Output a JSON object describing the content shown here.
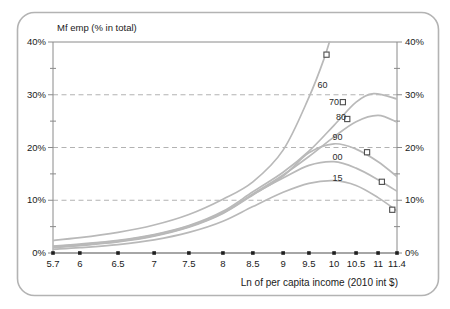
{
  "chart_data": {
    "type": "line",
    "title": "Mf emp (% in total)",
    "xlabel": "Ln of per capita income (2010 int $)",
    "ylabel": "",
    "ylim": [
      0,
      40
    ],
    "grid": "dashed-horizontal",
    "legend_position": "labels-on-curves",
    "y_major_ticks": [
      0,
      10,
      20,
      30,
      40
    ],
    "y_major_labels": [
      "0%",
      "10%",
      "20%",
      "30%",
      "40%"
    ],
    "y_minor_ticks": [
      5,
      15,
      25,
      35
    ],
    "dashed_gridlines": [
      10,
      20,
      30
    ],
    "x_ticks": [
      5.7,
      6,
      6.5,
      7,
      7.5,
      8,
      8.5,
      9,
      9.5,
      10,
      10.5,
      11,
      11.4
    ],
    "x_tick_labels": [
      "5.7",
      "6",
      "6.5",
      "7",
      "7.5",
      "8",
      "8.5",
      "9",
      "9.5",
      "10",
      "10.5",
      "11",
      "11.4"
    ],
    "x_tick_fractions": [
      0,
      0.078,
      0.189,
      0.294,
      0.395,
      0.494,
      0.581,
      0.669,
      0.744,
      0.817,
      0.881,
      0.945,
      1
    ],
    "colors": {
      "curve": "#b9b9b9",
      "gridline": "#a9a9a9",
      "axis": "#8a8a8a",
      "bottom_axis": "#4f4f4f",
      "tick_dot": "#1f1f1f",
      "marker_stroke": "#4d4d4d",
      "text": "#1a1a1a",
      "frame_border": "#b3b3b3"
    },
    "series": [
      {
        "name": "1960",
        "label": "60",
        "x": [
          5.7,
          6,
          6.5,
          7,
          7.5,
          8,
          8.5,
          9,
          9.5,
          9.8,
          9.97
        ],
        "y": [
          2.4,
          2.9,
          3.9,
          5.3,
          7.3,
          10.2,
          13.5,
          19.5,
          29.5,
          36.8,
          42.0
        ],
        "marker": {
          "x": 9.85,
          "y": 37.6
        },
        "label_at": {
          "x": 9.77,
          "y": 31.9
        }
      },
      {
        "name": "1970",
        "label": "70",
        "x": [
          5.7,
          6,
          6.5,
          7,
          7.5,
          8,
          8.5,
          9,
          9.5,
          10,
          10.5,
          10.9,
          11.4
        ],
        "y": [
          1.3,
          1.7,
          2.4,
          3.5,
          5.2,
          7.9,
          11.6,
          15.3,
          19.3,
          24.2,
          28.6,
          30.2,
          29.2
        ],
        "marker": {
          "x": 10.2,
          "y": 28.6
        },
        "label_at": {
          "x": 10.0,
          "y": 28.7
        }
      },
      {
        "name": "1980",
        "label": "80",
        "x": [
          5.7,
          6,
          6.5,
          7,
          7.5,
          8,
          8.5,
          9,
          9.5,
          10,
          10.5,
          11,
          11.4
        ],
        "y": [
          1.1,
          1.5,
          2.2,
          3.3,
          5.0,
          7.6,
          11.2,
          14.8,
          18.3,
          22.0,
          24.9,
          26.1,
          24.8
        ],
        "marker": {
          "x": 10.3,
          "y": 25.4
        },
        "label_at": {
          "x": 10.16,
          "y": 25.7
        }
      },
      {
        "name": "1990",
        "label": "90",
        "x": [
          5.7,
          6,
          6.5,
          7,
          7.5,
          8,
          8.5,
          9,
          9.5,
          10,
          10.5,
          11,
          11.4
        ],
        "y": [
          1.0,
          1.4,
          2.1,
          3.2,
          4.9,
          7.5,
          11.0,
          14.6,
          19.0,
          20.7,
          19.7,
          17.3,
          14.5
        ],
        "marker": {
          "x": 10.75,
          "y": 19.1
        },
        "label_at": {
          "x": 10.08,
          "y": 22.0
        }
      },
      {
        "name": "2000",
        "label": "00",
        "x": [
          5.7,
          6,
          6.5,
          7,
          7.5,
          8,
          8.5,
          9,
          9.5,
          10,
          10.5,
          11,
          11.4
        ],
        "y": [
          1.2,
          1.6,
          2.3,
          3.4,
          5.1,
          7.7,
          11.1,
          14.2,
          16.6,
          17.3,
          16.1,
          13.9,
          11.7
        ],
        "marker": {
          "x": 11.08,
          "y": 13.5
        },
        "label_at": {
          "x": 10.08,
          "y": 18.2
        }
      },
      {
        "name": "2015",
        "label": "15",
        "x": [
          5.7,
          6,
          6.5,
          7,
          7.5,
          8,
          8.5,
          9,
          9.5,
          10,
          10.5,
          11,
          11.4
        ],
        "y": [
          0.7,
          1.0,
          1.6,
          2.5,
          3.9,
          6.0,
          8.8,
          11.5,
          13.2,
          13.7,
          12.8,
          10.5,
          8.0
        ],
        "marker": {
          "x": 11.3,
          "y": 8.2
        },
        "label_at": {
          "x": 10.08,
          "y": 14.2
        }
      }
    ]
  }
}
